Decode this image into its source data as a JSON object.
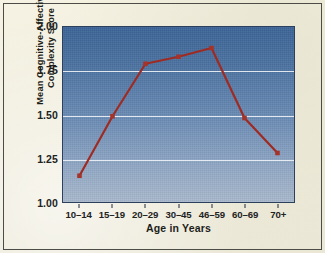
{
  "chart_data": {
    "type": "line",
    "title": "",
    "xlabel": "Age in Years",
    "ylabel": "Mean Cognitive-Affective Complexity Score",
    "ylabel_line1": "Mean Cognitive-Affective",
    "ylabel_line2": "Complexity Score",
    "categories": [
      "10–14",
      "15–19",
      "20–29",
      "30–45",
      "46–59",
      "60–69",
      "70+"
    ],
    "values": [
      1.15,
      1.49,
      1.79,
      1.83,
      1.88,
      1.48,
      1.28
    ],
    "series": [
      {
        "name": "Mean Cognitive-Affective Complexity Score",
        "values": [
          1.15,
          1.49,
          1.79,
          1.83,
          1.88,
          1.48,
          1.28
        ]
      }
    ],
    "ylim": [
      1.0,
      2.0
    ],
    "yticks": [
      1.0,
      1.25,
      1.5,
      1.75,
      2.0
    ],
    "ytick_labels": [
      "1.00",
      "1.25",
      "1.50",
      "1.75",
      "2.00"
    ],
    "grid": true,
    "gridlines_at": [
      1.25,
      1.5,
      1.75
    ],
    "legend": false,
    "legend_position": "none",
    "marker": "square",
    "colors": {
      "line": "#9e2b23",
      "marker": "#a4332a",
      "gridline": "#eef1f5",
      "plot_bg_top": "#3a6396",
      "plot_bg_bottom": "#a8b8cc",
      "page_bg": "#f2efdf",
      "frame": "#4b4d46",
      "text": "#22231f"
    }
  }
}
